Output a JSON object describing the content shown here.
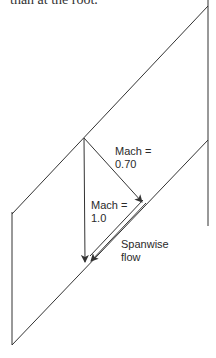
{
  "caption": "than at the root.",
  "labels": {
    "mach_070_line1": "Mach =",
    "mach_070_line2": "0.70",
    "mach_10_line1": "Mach =",
    "mach_10_line2": "1.0",
    "spanwise_line1": "Spanwise",
    "spanwise_line2": "flow"
  },
  "colors": {
    "line": "#333333",
    "background": "#ffffff"
  }
}
